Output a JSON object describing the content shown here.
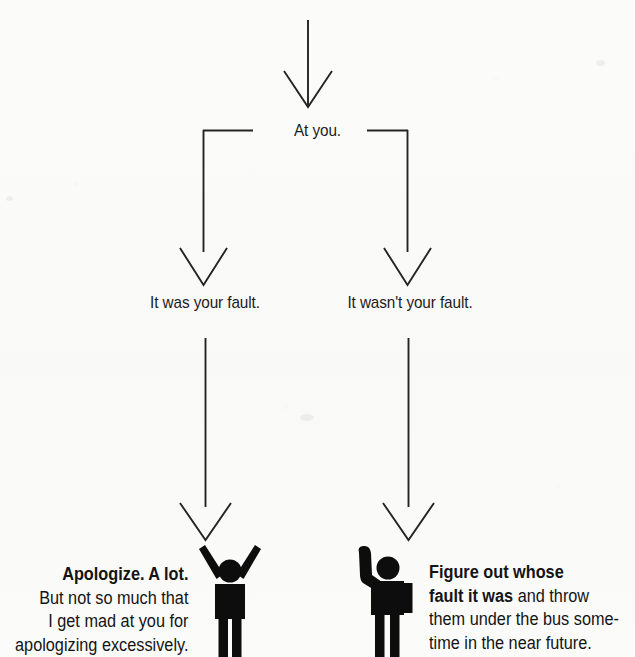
{
  "meta": {
    "diagram_title": "flowchart-when-someone-is-mad",
    "background_color": "#fbfbfa",
    "ink_color": "#1a1a1a",
    "width": 635,
    "height": 657
  },
  "top_partial_text": "",
  "nodes": {
    "at_you": "At you.",
    "your_fault": "It was your fault.",
    "not_your_fault": "It wasn't your fault."
  },
  "outcomes": {
    "left": {
      "bold_lead": "Apologize. A lot.",
      "lines": [
        "Apologize. A lot.",
        "But not so much that",
        "I get mad at you for",
        "apologizing excessively."
      ],
      "figure": "stick-figure-arms-raised"
    },
    "right": {
      "bold_lead": "Figure out whose fault it was",
      "lines": [
        "Figure out whose",
        "fault it was and throw",
        "them under the bus some-",
        "time in the near future."
      ],
      "figure": "stick-figure-arm-pointing"
    }
  },
  "connectors": [
    {
      "name": "entry-arrow",
      "from": [
        308,
        22
      ],
      "to": [
        308,
        108
      ],
      "style": "vertical-arrow"
    },
    {
      "name": "split-bar",
      "from": [
        203,
        130
      ],
      "to": [
        408,
        130
      ],
      "style": "horizontal-with-gap",
      "gap_label": "At you."
    },
    {
      "name": "left-branch-arrow",
      "from": [
        203,
        130
      ],
      "to": [
        203,
        285
      ],
      "style": "vertical-arrow"
    },
    {
      "name": "right-branch-arrow",
      "from": [
        408,
        130
      ],
      "to": [
        408,
        285
      ],
      "style": "vertical-arrow"
    },
    {
      "name": "left-outcome-arrow",
      "from": [
        205,
        338
      ],
      "to": [
        205,
        540
      ],
      "style": "vertical-arrow"
    },
    {
      "name": "right-outcome-arrow",
      "from": [
        408,
        338
      ],
      "to": [
        408,
        540
      ],
      "style": "vertical-arrow"
    }
  ],
  "chart_data": {
    "type": "diagram",
    "diagram_kind": "decision-flowchart",
    "title": "",
    "root": "At you.",
    "branches": [
      {
        "condition": "It was your fault.",
        "result": "Apologize. A lot. But not so much that I get mad at you for apologizing excessively."
      },
      {
        "condition": "It wasn't your fault.",
        "result": "Figure out whose fault it was and throw them under the bus sometime in the near future."
      }
    ]
  }
}
